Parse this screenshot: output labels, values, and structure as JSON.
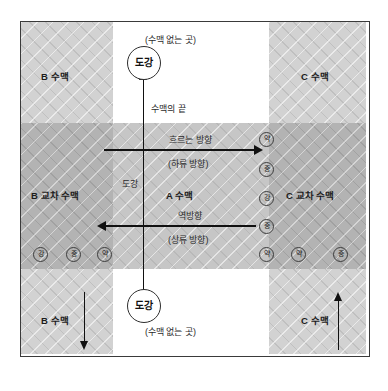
{
  "diagram": {
    "title_regions": {
      "b_top": "B 수맥",
      "b_cross": "B 교차 수맥",
      "b_bottom": "B 수맥",
      "c_top": "C 수맥",
      "c_cross": "C 교차 수맥",
      "c_bottom": "C 수맥",
      "a_center": "A 수맥"
    },
    "empty_zone_top": "(수맥 없는 곳)",
    "empty_zone_bottom": "(수맥 없는 곳)",
    "vein_end_label": "수맥의 끝",
    "crossing_label": "도강",
    "crossing_circle_top": "도강",
    "crossing_circle_bottom": "도강",
    "flow_arrow": {
      "main": "흐르는 방향",
      "sub": "(하류 방향)"
    },
    "reverse_arrow": {
      "main": "역방향",
      "sub": "(상류 방향)"
    },
    "strength_column_right": [
      "약",
      "중",
      "강",
      "중",
      "약"
    ],
    "strength_row_left": [
      "강",
      "중",
      "약"
    ],
    "strength_row_right": [
      "약",
      "중"
    ],
    "colors": {
      "band_fill": "#ababab",
      "light_fill": "#d2d2d2",
      "mid_fill": "#b3b3b3",
      "center_fill": "#c6c6c6",
      "line": "#111111",
      "frame": "#3a3a3a",
      "page": "#ffffff"
    }
  }
}
